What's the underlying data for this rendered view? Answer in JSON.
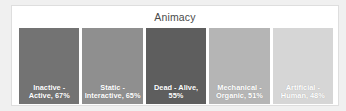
{
  "chart_data": {
    "type": "bar",
    "title": "Animacy",
    "xlabel": "",
    "ylabel": "",
    "grid": false,
    "legend": "none",
    "orientation": "treemap-like-equal-width-columns",
    "value_suffix": "%",
    "categories": [
      "Inactive - Active",
      "Static - Interactive",
      "Dead - Alive",
      "Mechanical - Organic",
      "Artificial - Human"
    ],
    "values": [
      67,
      65,
      55,
      51,
      48
    ],
    "data_labels": [
      "Inactive - Active, 67%",
      "Static - Interactive, 65%",
      "Dead - Alive, 55%",
      "Mechanical - Organic, 51%",
      "Artificial - Human, 48%"
    ],
    "colors": [
      "#737373",
      "#8f8f8f",
      "#5e5e5e",
      "#b5b5b5",
      "#d6d6d6"
    ],
    "ylim": [
      0,
      100
    ]
  },
  "style": {
    "frame_background": "#f0f0f0",
    "card_background": "#ffffff",
    "card_border": "#dedede",
    "title_color": "#4a4a4a",
    "label_color": "#ffffff"
  }
}
